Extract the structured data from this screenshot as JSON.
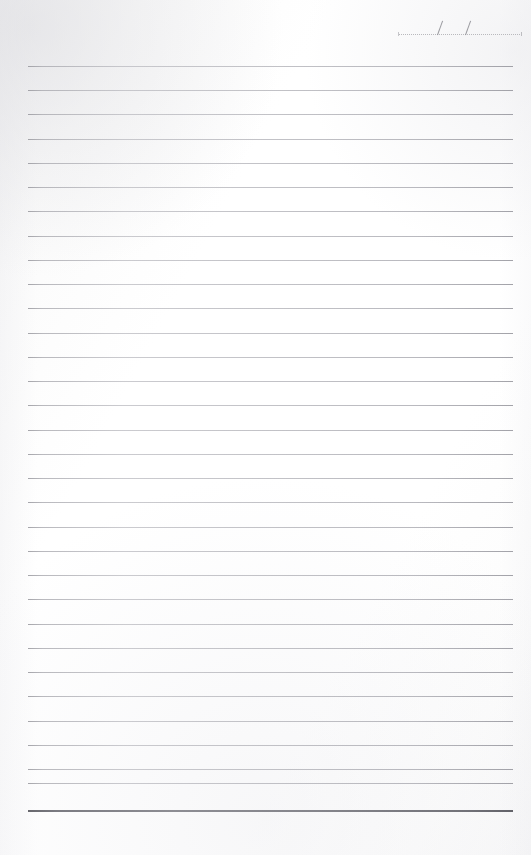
{
  "page": {
    "type": "lined-note-page",
    "width": 531,
    "height": 855,
    "background_color": "#ffffff",
    "paper_tint": "#fbfbfb"
  },
  "date_field": {
    "name": "date-line",
    "value": "",
    "placeholder": "__/__/__",
    "separator": "/",
    "separator_count": 2,
    "rule_style": "dotted",
    "rule_color": "#b9b9bd",
    "slash_color": "#8e8e94",
    "left": 398,
    "top": 14,
    "width": 122
  },
  "rules": {
    "name": "ruled-lines",
    "count": 31,
    "first_y": 66,
    "spacing": 24.3,
    "left": 28,
    "right": 513,
    "width": 485,
    "color": "#b0b0b6",
    "thickness": 1,
    "y_positions": [
      66,
      90,
      114,
      139,
      163,
      187,
      211,
      236,
      260,
      284,
      308,
      333,
      357,
      381,
      405,
      430,
      454,
      478,
      502,
      527,
      551,
      575,
      599,
      624,
      648,
      672,
      696,
      721,
      745,
      769,
      783
    ]
  },
  "footer_rule": {
    "name": "footer-rule",
    "y": 810,
    "left": 28,
    "width": 485,
    "thickness": 2,
    "color": "#6e6e75",
    "style": "double-bold"
  }
}
